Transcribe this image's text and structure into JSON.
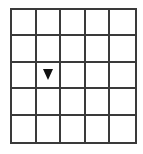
{
  "grid": {
    "rows": 5,
    "cols": 5,
    "line_color": "#3a3a3a",
    "background": "#ffffff"
  },
  "marker": {
    "shape": "triangle-down",
    "row": 2,
    "col": 1,
    "color": "#111111"
  }
}
